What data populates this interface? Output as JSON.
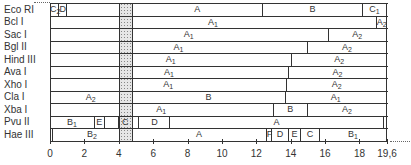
{
  "chart_data": {
    "type": "restriction-map",
    "title": "",
    "xlabel": "",
    "unit": "kb",
    "x_range": [
      0,
      19.6
    ],
    "x_ticks": [
      0,
      2,
      4,
      6,
      8,
      10,
      12,
      14,
      16,
      18,
      19.6
    ],
    "x_tick_labels": [
      "0",
      "2",
      "4",
      "6",
      "8",
      "10",
      "12",
      "14",
      "16",
      "18",
      "19,6"
    ],
    "shaded_region": [
      4.0,
      4.8
    ],
    "rows": [
      {
        "enzyme": "Eco RI",
        "fragments": [
          {
            "label": "C2",
            "start": 0,
            "end": 0.55
          },
          {
            "label": "D",
            "start": 0.55,
            "end": 1.0
          },
          {
            "label": "",
            "start": 1.0,
            "end": 4.8
          },
          {
            "label": "A",
            "start": 4.8,
            "end": 12.4
          },
          {
            "label": "B",
            "start": 12.4,
            "end": 18.2
          },
          {
            "label": "C1",
            "start": 18.2,
            "end": 19.6
          }
        ]
      },
      {
        "enzyme": "Bcl I",
        "fragments": [
          {
            "label": "A1",
            "start": 0,
            "end": 19.0
          },
          {
            "label": "A2",
            "start": 19.0,
            "end": 19.6
          }
        ]
      },
      {
        "enzyme": "Sac I",
        "fragments": [
          {
            "label": "A1",
            "start": 0,
            "end": 16.2
          },
          {
            "label": "A2",
            "start": 16.2,
            "end": 19.6
          }
        ]
      },
      {
        "enzyme": "Bgl II",
        "fragments": [
          {
            "label": "A1",
            "start": 0,
            "end": 15.0
          },
          {
            "label": "A2",
            "start": 15.0,
            "end": 19.6
          }
        ]
      },
      {
        "enzyme": "Hind III",
        "fragments": [
          {
            "label": "A1",
            "start": 0,
            "end": 14.1
          },
          {
            "label": "A2",
            "start": 14.1,
            "end": 19.6
          }
        ]
      },
      {
        "enzyme": "Ava I",
        "fragments": [
          {
            "label": "A1",
            "start": 0,
            "end": 13.9
          },
          {
            "label": "A2",
            "start": 13.9,
            "end": 19.6
          }
        ]
      },
      {
        "enzyme": "Xho I",
        "fragments": [
          {
            "label": "A1",
            "start": 0,
            "end": 13.8
          },
          {
            "label": "A2",
            "start": 13.8,
            "end": 19.6
          }
        ]
      },
      {
        "enzyme": "Cla I",
        "fragments": [
          {
            "label": "A2",
            "start": 0,
            "end": 4.8
          },
          {
            "label": "B",
            "start": 4.8,
            "end": 13.7
          },
          {
            "label": "A1",
            "start": 13.7,
            "end": 19.6
          }
        ]
      },
      {
        "enzyme": "Xba I",
        "fragments": [
          {
            "label": "A1",
            "start": 0,
            "end": 13.0
          },
          {
            "label": "B",
            "start": 13.0,
            "end": 15.0
          },
          {
            "label": "A2",
            "start": 15.0,
            "end": 19.6
          }
        ]
      },
      {
        "enzyme": "Pvu II",
        "fragments": [
          {
            "label": "B1",
            "start": 0,
            "end": 2.6
          },
          {
            "label": "E",
            "start": 2.6,
            "end": 3.2
          },
          {
            "label": "",
            "start": 3.2,
            "end": 4.0
          },
          {
            "label": "C",
            "start": 4.0,
            "end": 4.8
          },
          {
            "label": "",
            "start": 4.8,
            "end": 5.2
          },
          {
            "label": "D",
            "start": 5.2,
            "end": 7.0
          },
          {
            "label": "A",
            "start": 7.0,
            "end": 19.4
          },
          {
            "label": "B2",
            "start": 19.4,
            "end": 19.6
          }
        ]
      },
      {
        "enzyme": "Hae III",
        "fragments": [
          {
            "label": "",
            "start": 0,
            "end": 0.15
          },
          {
            "label": "B2",
            "start": 0.15,
            "end": 4.8
          },
          {
            "label": "A",
            "start": 4.8,
            "end": 12.6
          },
          {
            "label": "F",
            "start": 12.6,
            "end": 12.9
          },
          {
            "label": "D",
            "start": 12.9,
            "end": 13.9
          },
          {
            "label": "E",
            "start": 13.9,
            "end": 14.6
          },
          {
            "label": "C",
            "start": 14.6,
            "end": 15.7
          },
          {
            "label": "B1",
            "start": 15.7,
            "end": 19.6
          }
        ]
      }
    ]
  }
}
